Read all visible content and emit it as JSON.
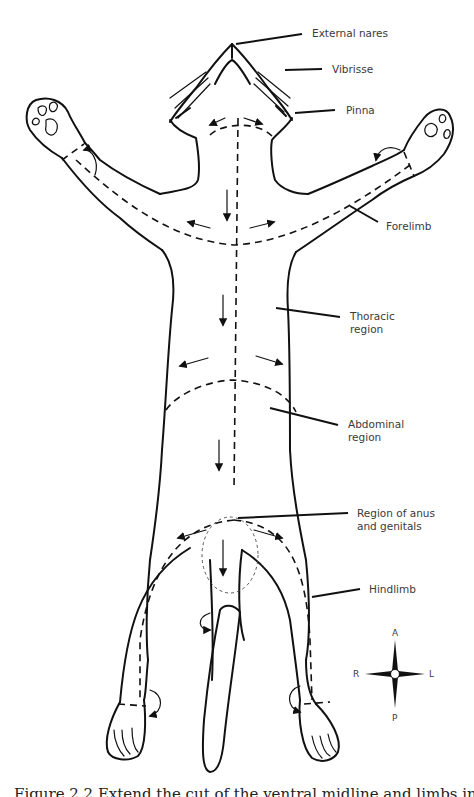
{
  "figure": {
    "labels": {
      "external_nares": "External nares",
      "vibrisse": "Vibrisse",
      "pinna": "Pinna",
      "forelimb": "Forelimb",
      "thoracic_line1": "Thoracic",
      "thoracic_line2": "region",
      "abdominal_line1": "Abdominal",
      "abdominal_line2": "region",
      "anus_line1": "Region of anus",
      "anus_line2": "and genitals",
      "hindlimb": "Hindlimb"
    },
    "compass": {
      "anterior": "A",
      "posterior": "P",
      "right": "R",
      "left": "L"
    },
    "line_styles": {
      "outline_color": "#111111",
      "label_color": "#3a3a3a",
      "cut_line": "dashed"
    }
  },
  "caption": {
    "text": "Figure 2.2  Extend the cut of the ventral midline and limbs in the cat for..."
  }
}
